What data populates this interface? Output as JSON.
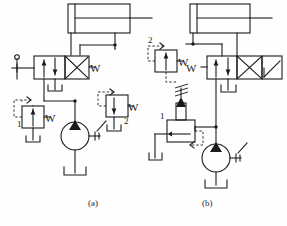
{
  "figure": {
    "type": "hydraulic-circuit-diagram",
    "panel_count": 2,
    "line_color": "#1a1a1a",
    "background_color": "#fefefe",
    "fill_color": "#1a1a1a"
  },
  "captions": [
    {
      "name": "panel-a-caption",
      "label": "(a)",
      "x": 92,
      "y": 203
    },
    {
      "name": "panel-b-caption",
      "label": "(b)",
      "x": 205,
      "y": 203
    }
  ],
  "panel_a": {
    "caption": "(a)",
    "components": [
      {
        "name": "cylinder",
        "label": "",
        "type": "double-acting-cylinder"
      },
      {
        "name": "directional-control-valve",
        "label": "W",
        "type": "4-3-way-valve",
        "actuator": "manual-lever"
      },
      {
        "name": "counterbalance-valve-1",
        "label": "1",
        "port_label": "W",
        "type": "pilot-operated-relief-valve"
      },
      {
        "name": "counterbalance-valve-2",
        "label": "2",
        "port_label": "W",
        "type": "pilot-operated-relief-valve"
      },
      {
        "name": "hydraulic-pump",
        "label": "",
        "type": "fixed-displacement-pump"
      },
      {
        "name": "reservoir-tank",
        "label": "",
        "type": "tank"
      }
    ],
    "valve_labels": {
      "main_valve_port": "W",
      "valve_1_number": "1",
      "valve_1_port": "W",
      "valve_2_number": "2",
      "valve_2_port": "W"
    }
  },
  "panel_b": {
    "caption": "(b)",
    "components": [
      {
        "name": "cylinder",
        "label": "",
        "type": "double-acting-cylinder"
      },
      {
        "name": "directional-control-valve",
        "label": "W",
        "type": "4-3-way-valve"
      },
      {
        "name": "relief-valve-2",
        "label": "2",
        "port_label": "W",
        "type": "pilot-operated-relief-valve"
      },
      {
        "name": "relief-valve-1",
        "label": "1",
        "type": "adjustable-spring-relief-valve"
      },
      {
        "name": "hydraulic-pump",
        "label": "",
        "type": "fixed-displacement-pump"
      },
      {
        "name": "reservoir-tank",
        "label": "",
        "type": "tank"
      }
    ],
    "valve_labels": {
      "main_valve_port": "W",
      "valve_2_number": "2",
      "valve_2_port": "W",
      "valve_1_number": "1"
    }
  }
}
